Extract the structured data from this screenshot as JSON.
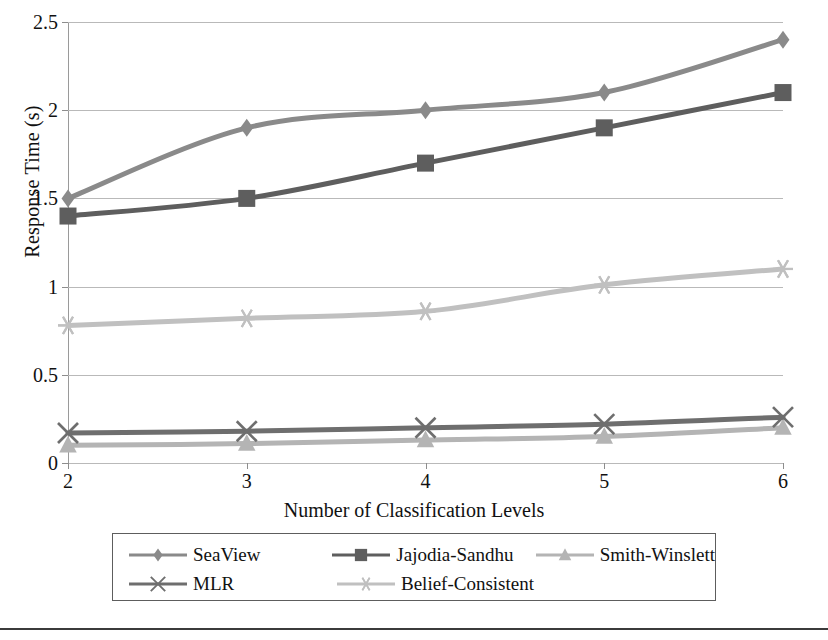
{
  "axes": {
    "ylabel": "Response Time (s)",
    "xlabel": "Number of Classification Levels",
    "yticks": [
      "0",
      "0.5",
      "1",
      "1.5",
      "2",
      "2.5"
    ],
    "xticks": [
      "2",
      "3",
      "4",
      "5",
      "6"
    ]
  },
  "legend": {
    "entries": [
      {
        "label": "SeaView",
        "marker": "diamond-marker",
        "color": "#8a8a8a"
      },
      {
        "label": "Jajodia-Sandhu",
        "marker": "square-marker",
        "color": "#5e5e5e"
      },
      {
        "label": "Smith-Winslett",
        "marker": "triangle-marker",
        "color": "#b4b4b4"
      },
      {
        "label": "MLR",
        "marker": "cross-marker",
        "color": "#6e6e6e"
      },
      {
        "label": "Belief-Consistent",
        "marker": "star-marker",
        "color": "#c0c0c0"
      }
    ]
  },
  "chart_data": {
    "type": "line",
    "title": "",
    "xlabel": "Number of Classification Levels",
    "ylabel": "Response Time (s)",
    "x": [
      2,
      3,
      4,
      5,
      6
    ],
    "xlim": [
      2,
      6
    ],
    "ylim": [
      0,
      2.5
    ],
    "ytick_values": [
      0,
      0.5,
      1,
      1.5,
      2,
      2.5
    ],
    "grid": "horizontal",
    "legend_position": "bottom",
    "series": [
      {
        "name": "SeaView",
        "marker": "diamond",
        "color": "#8a8a8a",
        "values": [
          1.5,
          1.9,
          2.0,
          2.1,
          2.4
        ]
      },
      {
        "name": "Jajodia-Sandhu",
        "marker": "square",
        "color": "#5e5e5e",
        "values": [
          1.4,
          1.5,
          1.7,
          1.9,
          2.1
        ]
      },
      {
        "name": "Smith-Winslett",
        "marker": "triangle",
        "color": "#b4b4b4",
        "values": [
          0.1,
          0.11,
          0.13,
          0.15,
          0.2
        ]
      },
      {
        "name": "MLR",
        "marker": "cross",
        "color": "#6e6e6e",
        "values": [
          0.17,
          0.18,
          0.2,
          0.22,
          0.26
        ]
      },
      {
        "name": "Belief-Consistent",
        "marker": "star",
        "color": "#c0c0c0",
        "values": [
          0.78,
          0.82,
          0.86,
          1.01,
          1.1
        ]
      }
    ]
  }
}
